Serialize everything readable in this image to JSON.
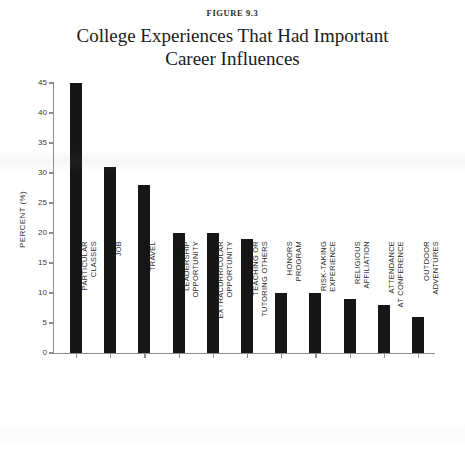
{
  "figure": {
    "label": "FIGURE 9.3",
    "title_line1": "College Experiences That Had Important",
    "title_line2": "Career Influences"
  },
  "chart_data": {
    "type": "bar",
    "title": "College Experiences That Had Important Career Influences",
    "subtitle": "FIGURE 9.3",
    "xlabel": "",
    "ylabel": "PERCENT (%)",
    "ylim": [
      0,
      45
    ],
    "ytick_step": 5,
    "yticks": [
      "45",
      "40",
      "35",
      "30",
      "25",
      "20",
      "15",
      "10",
      "5",
      "0"
    ],
    "grid": false,
    "legend": "none",
    "bar_color": "#161616",
    "axis_color": "#8d8d8d",
    "categories": [
      "PARTICULAR\nCLASSES",
      "JOB",
      "TRAVEL",
      "LEADERSHIP\nOPPORTUNITY",
      "EXTRACURRICULAR\nOPPORTUNITY",
      "TEACHING OR\nTUTORING OTHERS",
      "HONORS\nPROGRAM",
      "RISK-TAKING\nEXPERIENCE",
      "RELIGIOUS\nAFFILIATION",
      "ATTENDANCE\nAT CONFERENCE",
      "OUTDOOR\nADVENTURES"
    ],
    "values": [
      45,
      31,
      28,
      20,
      20,
      19,
      10,
      10,
      9,
      8,
      6
    ]
  }
}
